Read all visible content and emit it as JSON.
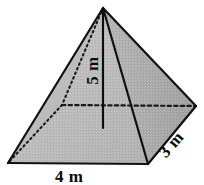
{
  "figure": {
    "type": "square-pyramid-diagram",
    "background_color": "#ffffff",
    "stroke_color": "#111111",
    "face_left_color": "#b9b9b9",
    "face_right_color": "#a8a8a8",
    "face_base_color": "#b0b0b0",
    "labels": {
      "height": "5 m",
      "depth": "3 m",
      "base": "4 m"
    },
    "geometry": {
      "apex": [
        103,
        8
      ],
      "front_left": [
        8,
        163
      ],
      "front_right": [
        148,
        164
      ],
      "back_right": [
        196,
        106
      ],
      "back_left": [
        62,
        105
      ],
      "height_foot": [
        103,
        128
      ]
    }
  }
}
